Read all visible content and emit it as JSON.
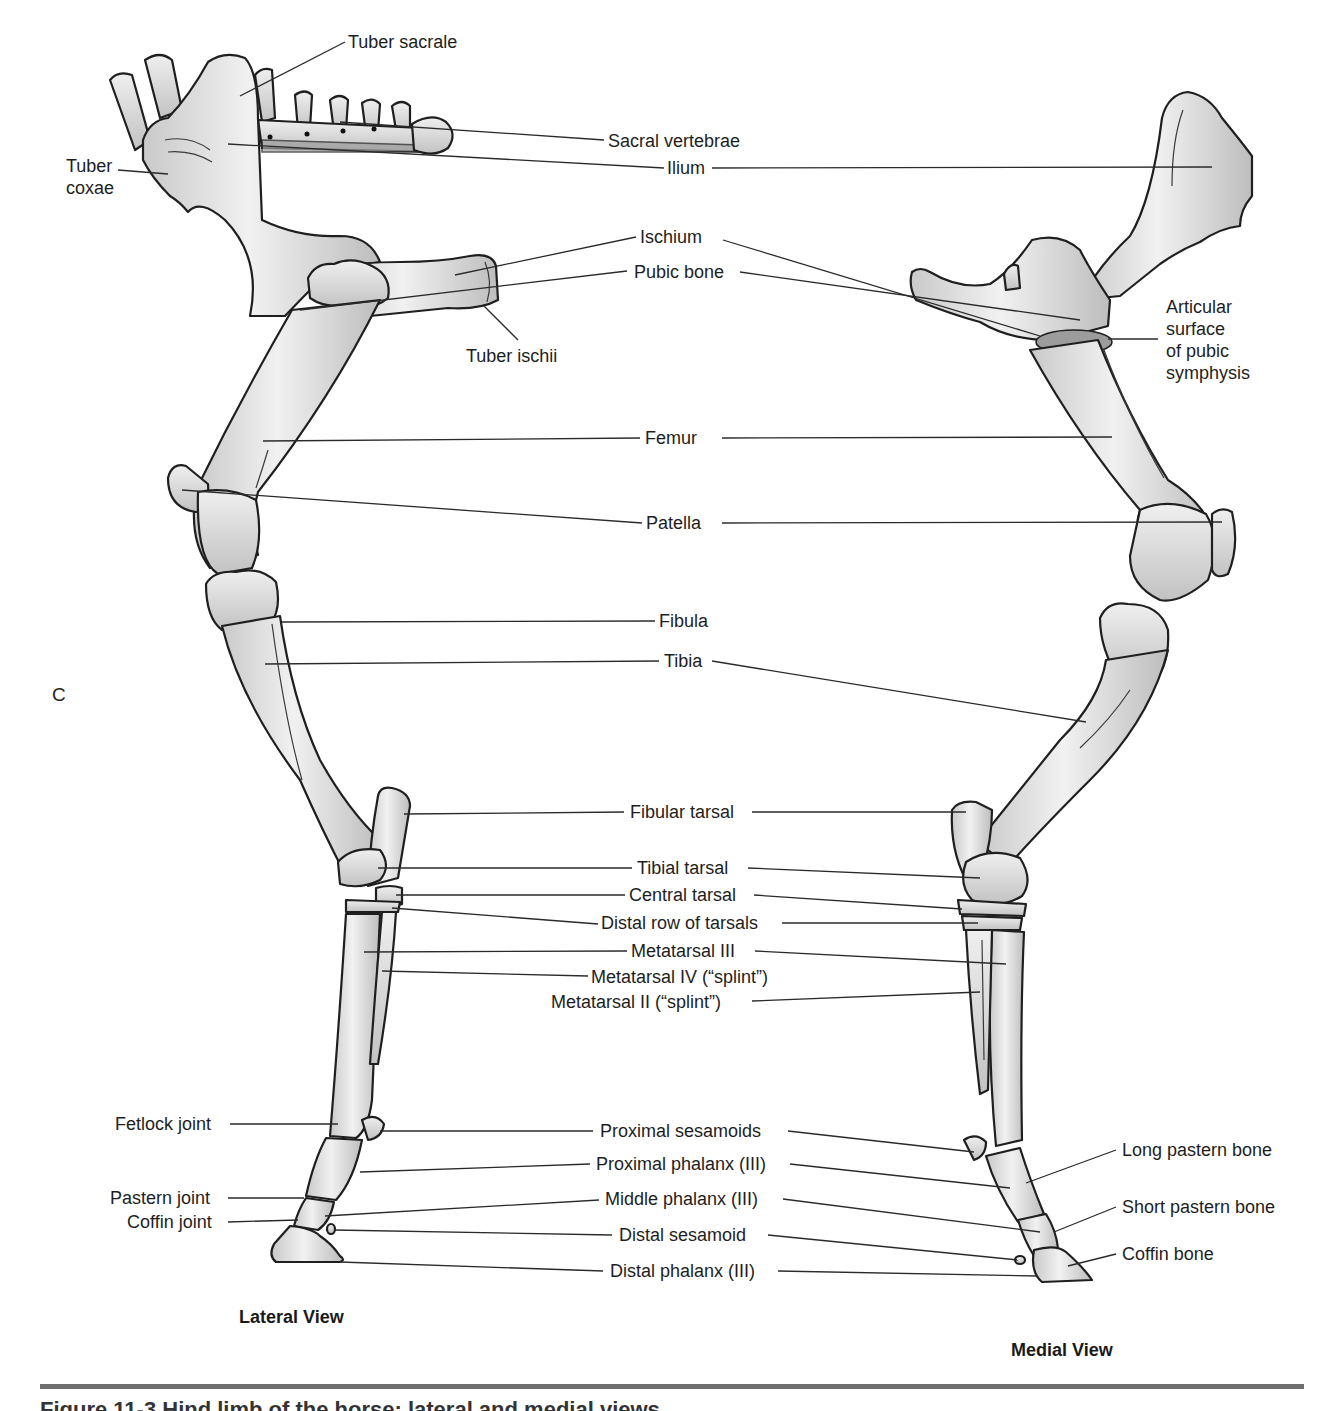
{
  "figure": {
    "panel_letter": "C",
    "caption_partial": "Figure 11-3 Hind limb of the horse: lateral and medial views",
    "colors": {
      "bone_light": "#eeeeee",
      "bone_shade": "#c4c4c4",
      "outline": "#1f1f1f",
      "rule": "#6e6e6e"
    }
  },
  "views": {
    "lateral": {
      "title": "Lateral View"
    },
    "medial": {
      "title": "Medial View"
    }
  },
  "labels": {
    "tuber_sacrale": "Tuber sacrale",
    "tuber_coxae": "Tuber\ncoxae",
    "sacral_vertebrae": "Sacral vertebrae",
    "ilium": "Ilium",
    "ischium": "Ischium",
    "pubic_bone": "Pubic bone",
    "tuber_ischii": "Tuber ischii",
    "articular_surface": "Articular\nsurface\nof pubic\nsymphysis",
    "femur": "Femur",
    "patella": "Patella",
    "fibula": "Fibula",
    "tibia": "Tibia",
    "fibular_tarsal": "Fibular tarsal",
    "tibial_tarsal": "Tibial tarsal",
    "central_tarsal": "Central tarsal",
    "distal_row_tarsals": "Distal row of tarsals",
    "metatarsal_iii": "Metatarsal III",
    "metatarsal_iv": "Metatarsal IV (“splint”)",
    "metatarsal_ii": "Metatarsal II (“splint”)",
    "fetlock_joint": "Fetlock joint",
    "pastern_joint": "Pastern joint",
    "coffin_joint": "Coffin joint",
    "proximal_sesamoids": "Proximal sesamoids",
    "proximal_phalanx": "Proximal phalanx (III)",
    "middle_phalanx": "Middle phalanx (III)",
    "distal_sesamoid": "Distal sesamoid",
    "distal_phalanx": "Distal phalanx (III)",
    "long_pastern_bone": "Long pastern bone",
    "short_pastern_bone": "Short pastern bone",
    "coffin_bone": "Coffin bone"
  }
}
